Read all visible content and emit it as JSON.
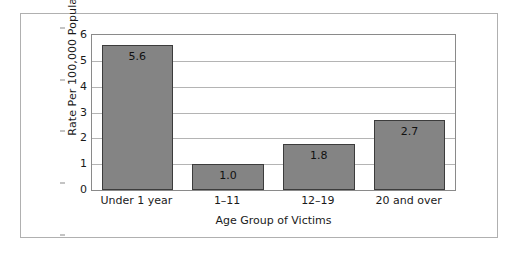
{
  "chart_data": {
    "type": "bar",
    "title": "",
    "subtitle": "",
    "xlabel": "Age Group of Victims",
    "ylabel": "Rate Per 100,000 Population",
    "categories": [
      "Under 1 year",
      "1–11",
      "12–19",
      "20 and over"
    ],
    "values": [
      5.6,
      1.0,
      1.8,
      2.7
    ],
    "value_labels": [
      "5.6",
      "1.0",
      "1.8",
      "2.7"
    ],
    "ylim": [
      0,
      6
    ],
    "yticks": [
      0,
      1,
      2,
      3,
      4,
      5,
      6
    ],
    "ytick_labels": [
      "0",
      "1",
      "2",
      "3",
      "4",
      "5",
      "6"
    ],
    "grid": "horizontal",
    "legend": "none",
    "bar_color": "#848484",
    "bar_border_color": "#3c3c3c",
    "plot_border_color": "#8a8a8a",
    "gridline_color": "#b4b4b4",
    "frame_border_color": "#b0b0b0",
    "background_color": "#ffffff"
  }
}
